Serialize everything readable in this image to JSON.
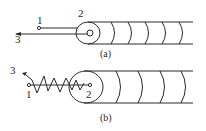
{
  "figure_a": {
    "caption": "(a)",
    "labels": {
      "point1": "1",
      "point2": "2",
      "beam3": "3"
    }
  },
  "figure_b": {
    "caption": "(b)",
    "labels": {
      "point1": "1",
      "point2": "2",
      "beam3": "3"
    }
  }
}
